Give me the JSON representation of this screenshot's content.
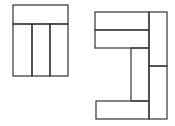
{
  "diagram": {
    "stroke": "#333333",
    "background": "#ffffff",
    "figures": [
      {
        "name": "left-figure",
        "rects": [
          {
            "name": "top-bar",
            "x": 13,
            "y": 5,
            "w": 55,
            "h": 19
          },
          {
            "name": "column-1",
            "x": 13,
            "y": 24,
            "w": 19,
            "h": 52
          },
          {
            "name": "column-2",
            "x": 32,
            "y": 24,
            "w": 18,
            "h": 52
          },
          {
            "name": "column-3",
            "x": 50,
            "y": 24,
            "w": 18,
            "h": 52
          }
        ]
      },
      {
        "name": "right-figure",
        "rects": [
          {
            "name": "top-bar-upper",
            "x": 95,
            "y": 12,
            "w": 54,
            "h": 18
          },
          {
            "name": "top-bar-lower",
            "x": 95,
            "y": 30,
            "w": 54,
            "h": 18
          },
          {
            "name": "middle-column",
            "x": 131,
            "y": 48,
            "w": 18,
            "h": 53
          },
          {
            "name": "right-column-upper",
            "x": 149,
            "y": 12,
            "w": 18,
            "h": 54
          },
          {
            "name": "right-column-lower",
            "x": 149,
            "y": 66,
            "w": 18,
            "h": 53
          },
          {
            "name": "bottom-bar",
            "x": 96,
            "y": 101,
            "w": 53,
            "h": 18
          }
        ]
      }
    ]
  }
}
